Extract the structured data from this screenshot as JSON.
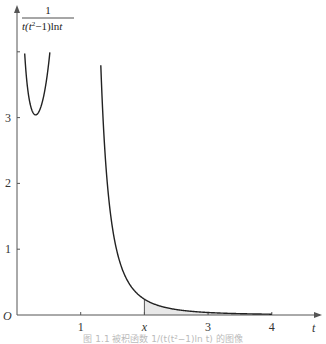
{
  "chart_data": {
    "type": "line",
    "title": "",
    "function": "1/(t(t^2-1) ln t)",
    "ylabel": {
      "numerator": "1",
      "denominator_parts": [
        "t(t",
        "2",
        "−1)ln",
        "t"
      ]
    },
    "xlabel": "t",
    "origin_label": "O",
    "xlim": [
      0,
      4.5
    ],
    "ylim": [
      0,
      4
    ],
    "x_ticks": [
      {
        "value": 1,
        "label": "1"
      },
      {
        "value": 2,
        "label": "x"
      },
      {
        "value": 3,
        "label": "3"
      },
      {
        "value": 4,
        "label": ""
      }
    ],
    "x_tick_labels_extra": [
      {
        "value": 4,
        "label": "4"
      }
    ],
    "y_ticks": [
      {
        "value": 1,
        "label": "1"
      },
      {
        "value": 2,
        "label": "2"
      },
      {
        "value": 3,
        "label": "3"
      },
      {
        "value": 4,
        "label": ""
      }
    ],
    "series": [
      {
        "name": "left-branch",
        "t_range": [
          0.1,
          0.62
        ],
        "color": "#222222"
      },
      {
        "name": "right-branch",
        "t_range": [
          1.27,
          4.0
        ],
        "color": "#222222"
      }
    ],
    "shaded_region": {
      "from": 2,
      "to": 4,
      "color": "#e8e8e8",
      "label": "area under curve from x to 4"
    },
    "grid": false,
    "legend": "none",
    "caption": "图 1.1  被积函数 1/(t(t²−1)ln t) 的图像"
  }
}
